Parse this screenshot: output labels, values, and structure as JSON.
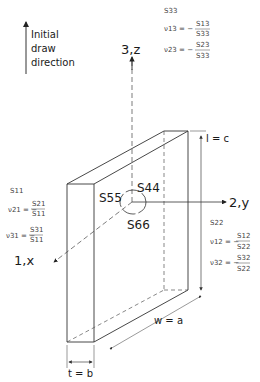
{
  "draw_direction": {
    "label_lines": [
      "Initial",
      "draw",
      "direction"
    ]
  },
  "axes": {
    "z": "3,z",
    "y": "2,y",
    "x": "1,x"
  },
  "compliances": {
    "shear_yz": "S44",
    "shear_xz": "S55",
    "shear_xy": "S66"
  },
  "dimensions": {
    "length": "l = c",
    "width": "w = a",
    "thickness": "t = b"
  },
  "axis3_props": {
    "compliance": "S33",
    "nu13_lhs": "ν13 = −",
    "nu13_num": "S13",
    "nu13_den": "S33",
    "nu23_lhs": "ν23 = −",
    "nu23_num": "S23",
    "nu23_den": "S33"
  },
  "axis1_props": {
    "compliance": "S11",
    "nu21_lhs": "ν21 = −",
    "nu21_num": "S21",
    "nu21_den": "S11",
    "nu31_lhs": "ν31 = −",
    "nu31_num": "S31",
    "nu31_den": "S11"
  },
  "axis2_props": {
    "compliance": "S22",
    "nu12_lhs": "ν12 = −",
    "nu12_num": "S12",
    "nu12_den": "S22",
    "nu32_lhs": "ν32 = −",
    "nu32_num": "S32",
    "nu32_den": "S22"
  }
}
